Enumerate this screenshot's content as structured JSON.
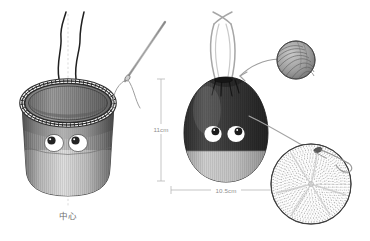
{
  "illustration": {
    "title": "Knitted drawstring pouch construction diagram",
    "background_color": "#ffffff"
  },
  "labels": {
    "center_label": "中心",
    "height_dim": "11cm",
    "width_dim": "10.5cm"
  },
  "colors": {
    "outline": "#4a4a4a",
    "dim_line": "#b6b6b6",
    "dim_text": "#8e8e8e",
    "bag_dark": "#3c3c3c",
    "bag_light": "#c9c9c9",
    "basket_mid": "#9a9a9a",
    "eye_white": "#ffffff",
    "eye_pupil": "#2a2a2a",
    "yarn": "#9b9b9b",
    "thread": "#9e9e9e",
    "cord_dark": "#2b2b2b",
    "disc_stitch": "#a9a9a9"
  },
  "parts": {
    "left_figure": {
      "name": "open cylindrical knitted basket",
      "rim_band": "cross-stitch decorative band",
      "eyes_count": 2,
      "drawstring_cords": 2,
      "center_guide": "dashed vertical center line"
    },
    "right_figure": {
      "name": "closed drawstring pouch",
      "handle": "looped drawstring handle",
      "eyes_count": 2,
      "bottom_band": "light contrast band"
    },
    "needle": {
      "name": "tapestry needle with thread"
    },
    "yarn_ball": {
      "name": "ball of yarn"
    },
    "base_disc": {
      "name": "crocheted circular base",
      "clasp": "hook clasp with cord"
    }
  }
}
